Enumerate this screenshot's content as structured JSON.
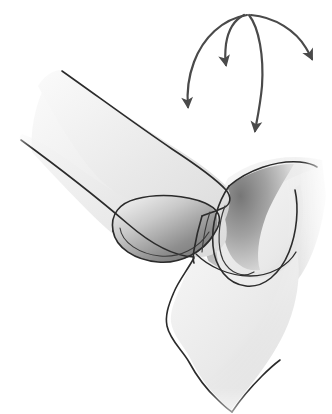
{
  "figure": {
    "title": "Anatomical line illustration of interlocking tissue lobes with motion arrows",
    "caption": "",
    "width": 332,
    "height": 414,
    "background_color": "#ffffff",
    "style": {
      "outline_color": "#2b2b2b",
      "outline_width": 1.6,
      "fill_light": "#f2f2f2",
      "fill_mid": "#dedede",
      "fill_shadow": "#8f8f8f",
      "fill_deep_shadow": "#6f6f6f",
      "arrow_color": "#4a4a4a",
      "arrow_width": 2.2
    },
    "shapes": [
      {
        "name": "left-lobe",
        "label": "Upper left tissue flap",
        "fill": "gradient-light",
        "path": "M 62 72 C 95 95 140 125 175 148 C 200 164 216 178 226 190 C 232 197 230 205 222 208 C 200 216 170 214 150 206 C 130 198 118 186 108 172 C 96 155 78 128 62 104 Z"
      },
      {
        "name": "left-lobe-underside",
        "label": "Lower left tissue flap edge",
        "fill": "gradient-light",
        "path": "M 22 143 C 60 170 100 200 128 224 C 150 242 172 256 196 258 C 212 259 222 252 226 242 L 226 200 C 200 210 168 208 146 198 C 120 186 92 168 60 148 Z"
      },
      {
        "name": "left-inner-cavity",
        "label": "Inner concave recess of left lobe",
        "fill": "gradient-shadow",
        "path": "M 120 206 C 140 196 170 196 192 202 C 210 207 216 218 210 232 C 200 252 172 262 148 258 C 126 254 114 240 113 226 C 112 216 115 210 120 206 Z"
      },
      {
        "name": "right-lobe",
        "label": "Right tissue lobe",
        "fill": "gradient-shadow",
        "path": "M 228 186 C 250 172 280 164 312 168 C 300 186 288 210 280 232 C 270 258 252 272 234 270 C 216 268 204 254 200 238 C 196 220 208 198 228 186 Z"
      },
      {
        "name": "lower-body",
        "label": "Lower tissue column",
        "fill": "gradient-light",
        "path": "M 192 258 C 182 278 168 292 170 308 C 172 328 186 344 192 362 C 198 378 210 392 222 404 L 240 386 C 258 370 276 352 286 330 C 296 306 300 280 296 260 Z"
      }
    ],
    "arrows": [
      {
        "name": "arrow-far-left",
        "label": "Leftmost downward curved motion arrow",
        "start": [
          246,
          14
        ],
        "end": [
          188,
          112
        ],
        "curve": "M 246 14 C 224 20 204 42 194 70 C 189 84 188 98 188 108"
      },
      {
        "name": "arrow-left-short",
        "label": "Short inner-left downward motion arrow",
        "start": [
          244,
          14
        ],
        "end": [
          226,
          70
        ],
        "curve": "M 244 14 C 236 18 230 30 228 44 C 227 54 226 62 226 66"
      },
      {
        "name": "arrow-center",
        "label": "Center long downward motion arrow",
        "start": [
          248,
          14
        ],
        "end": [
          254,
          134
        ],
        "curve": "M 248 14 C 258 26 264 54 262 84 C 260 108 256 124 254 130"
      },
      {
        "name": "arrow-right",
        "label": "Rightmost downward curved motion arrow",
        "start": [
          250,
          14
        ],
        "end": [
          312,
          62
        ],
        "curve": "M 250 14 C 274 16 296 30 306 48 C 310 54 311 58 312 60"
      }
    ]
  }
}
